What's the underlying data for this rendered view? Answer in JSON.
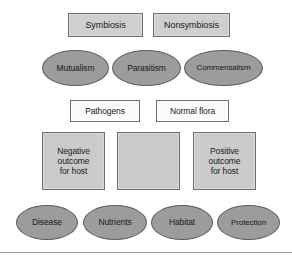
{
  "diagram": {
    "colors": {
      "rect_fill": "#cfcfcf",
      "rect_light_fill": "#fbfbfb",
      "square_fill": "#cbcbcb",
      "ellipse_fill": "#9c9c9c",
      "stroke": "#6e6e6e",
      "ellipse_stroke": "#5d5d5d",
      "text": "#1a1a1a",
      "rule": "#9e9e9e",
      "background": "#ffffff"
    },
    "rows": {
      "row1_top_categories": [
        {
          "id": "symbiosis",
          "label": "Symbiosis"
        },
        {
          "id": "nonsymbiosis",
          "label": "Nonsymbiosis"
        }
      ],
      "row2_relationships": [
        {
          "id": "mutualism",
          "label": "Mutualism"
        },
        {
          "id": "parasitism",
          "label": "Parasitism"
        },
        {
          "id": "commensalism",
          "label": "Commensalism"
        }
      ],
      "row3_organisms": [
        {
          "id": "pathogens",
          "label": "Pathogens"
        },
        {
          "id": "normal-flora",
          "label": "Normal flora"
        }
      ],
      "row4_outcomes": [
        {
          "id": "negative-outcome",
          "label": "Negative\noutcome\nfor host"
        },
        {
          "id": "blank-outcome",
          "label": ""
        },
        {
          "id": "positive-outcome",
          "label": "Positive\noutcome\nfor host"
        }
      ],
      "row5_effects": [
        {
          "id": "disease",
          "label": "Disease"
        },
        {
          "id": "nutrients",
          "label": "Nutrients"
        },
        {
          "id": "habitat",
          "label": "Habitat"
        },
        {
          "id": "protection",
          "label": "Protection"
        }
      ]
    }
  }
}
